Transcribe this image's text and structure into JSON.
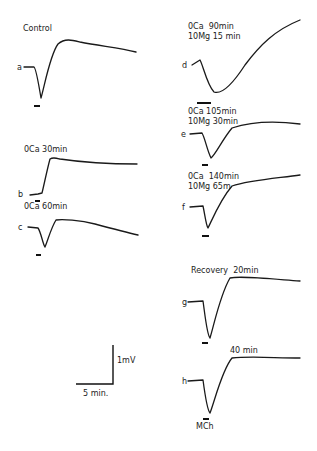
{
  "figure": {
    "panels": [
      {
        "id": "a",
        "letter": "a",
        "title": "Control"
      },
      {
        "id": "b",
        "letter": "b",
        "title": "0Ca 30min"
      },
      {
        "id": "c",
        "letter": "c",
        "title": "0Ca 60min"
      },
      {
        "id": "d",
        "letter": "d",
        "title": "0Ca  90min",
        "subtitle": "10Mg 15 min"
      },
      {
        "id": "e",
        "letter": "e",
        "title": "0Ca 105min",
        "subtitle": "10Mg 30min"
      },
      {
        "id": "f",
        "letter": "f",
        "title": "0Ca  140min",
        "subtitle": "10Mg 65m"
      },
      {
        "id": "g",
        "letter": "g",
        "title": "Recovery  20min"
      },
      {
        "id": "h",
        "letter": "h",
        "title": "40 min"
      }
    ],
    "stimulus_label": "MCh",
    "scale_bar": {
      "voltage": "1mV",
      "time": "5 min."
    }
  }
}
